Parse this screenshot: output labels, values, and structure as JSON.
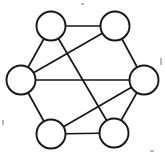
{
  "figure": {
    "title": "",
    "caption": "",
    "background_color": "#ffffff",
    "width": 165,
    "height": 160
  },
  "style": {
    "node_fill": "#ffffff",
    "node_stroke": "#16161a",
    "node_stroke_width": 1.9,
    "node_radius": 14.5,
    "edge_color": "#16161a",
    "edge_width": 1.7,
    "speck_color": "#b9b9bd"
  },
  "graph": {
    "type": "undirected-graph",
    "layout": "hexagonal-ring",
    "node_count": 6,
    "edge_count": 10,
    "degree_sequence": [
      3,
      3,
      4,
      4,
      3,
      3
    ],
    "nodes": [
      {
        "id": "top-left",
        "label": "",
        "x": 51,
        "y": 26,
        "degree": 3
      },
      {
        "id": "top-right",
        "label": "",
        "x": 115,
        "y": 26,
        "degree": 3
      },
      {
        "id": "left",
        "label": "",
        "x": 21,
        "y": 80,
        "degree": 4
      },
      {
        "id": "right",
        "label": "",
        "x": 144,
        "y": 80,
        "degree": 4
      },
      {
        "id": "bottom-left",
        "label": "",
        "x": 51,
        "y": 134,
        "degree": 3
      },
      {
        "id": "bottom-right",
        "label": "",
        "x": 114,
        "y": 133,
        "degree": 3
      }
    ],
    "edges": [
      {
        "id": "edge-tl-tr",
        "from": "top-left",
        "to": "top-right",
        "kind": "perimeter",
        "label": ""
      },
      {
        "id": "edge-tr-r",
        "from": "top-right",
        "to": "right",
        "kind": "perimeter",
        "label": ""
      },
      {
        "id": "edge-r-br",
        "from": "right",
        "to": "bottom-right",
        "kind": "perimeter",
        "label": ""
      },
      {
        "id": "edge-br-bl",
        "from": "bottom-right",
        "to": "bottom-left",
        "kind": "perimeter",
        "label": ""
      },
      {
        "id": "edge-bl-l",
        "from": "bottom-left",
        "to": "left",
        "kind": "perimeter",
        "label": ""
      },
      {
        "id": "edge-l-tl",
        "from": "left",
        "to": "top-left",
        "kind": "perimeter",
        "label": ""
      },
      {
        "id": "edge-l-r",
        "from": "left",
        "to": "right",
        "kind": "chord",
        "label": ""
      },
      {
        "id": "edge-l-tr",
        "from": "left",
        "to": "top-right",
        "kind": "chord",
        "label": ""
      },
      {
        "id": "edge-tl-br",
        "from": "top-left",
        "to": "bottom-right",
        "kind": "chord",
        "label": ""
      },
      {
        "id": "edge-bl-r",
        "from": "bottom-left",
        "to": "right",
        "kind": "chord",
        "label": ""
      }
    ]
  },
  "artifacts": {
    "specks": [
      {
        "x": 81,
        "y": 3,
        "w": 3,
        "h": 2
      },
      {
        "x": 160,
        "y": 58,
        "w": 2,
        "h": 7
      },
      {
        "x": 2,
        "y": 120,
        "w": 2,
        "h": 5
      },
      {
        "x": 150,
        "y": 150,
        "w": 4,
        "h": 2
      }
    ]
  }
}
